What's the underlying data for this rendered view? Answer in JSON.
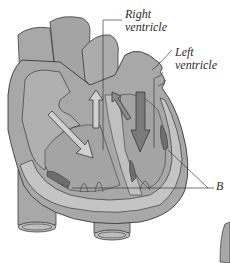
{
  "diagram": {
    "type": "anatomical-illustration",
    "colors": {
      "background": "#ffffff",
      "tissue": "#a8a8a8",
      "tissue_light": "#bdbdbd",
      "wall_texture": "#c4c4c4",
      "outline": "#3a3a3a",
      "dark_muscle": "#6e6e6e",
      "arrow_dark": "#7a7a7a",
      "arrow_light": "#d0d0d0"
    },
    "labels": [
      {
        "id": "right-ventricle",
        "line1": "Right",
        "line2": "ventricle"
      },
      {
        "id": "left-ventricle",
        "line1": "Left",
        "line2": "ventricle"
      },
      {
        "id": "b-label",
        "line1": "B"
      }
    ],
    "arrows": [
      {
        "id": "arrow-diagonal-left",
        "direction": "down-right",
        "style": "light"
      },
      {
        "id": "arrow-up-center",
        "direction": "up",
        "style": "light"
      },
      {
        "id": "arrow-diagonal-right",
        "direction": "up-left",
        "style": "dark"
      },
      {
        "id": "arrow-down-right",
        "direction": "down",
        "style": "dark"
      }
    ]
  }
}
